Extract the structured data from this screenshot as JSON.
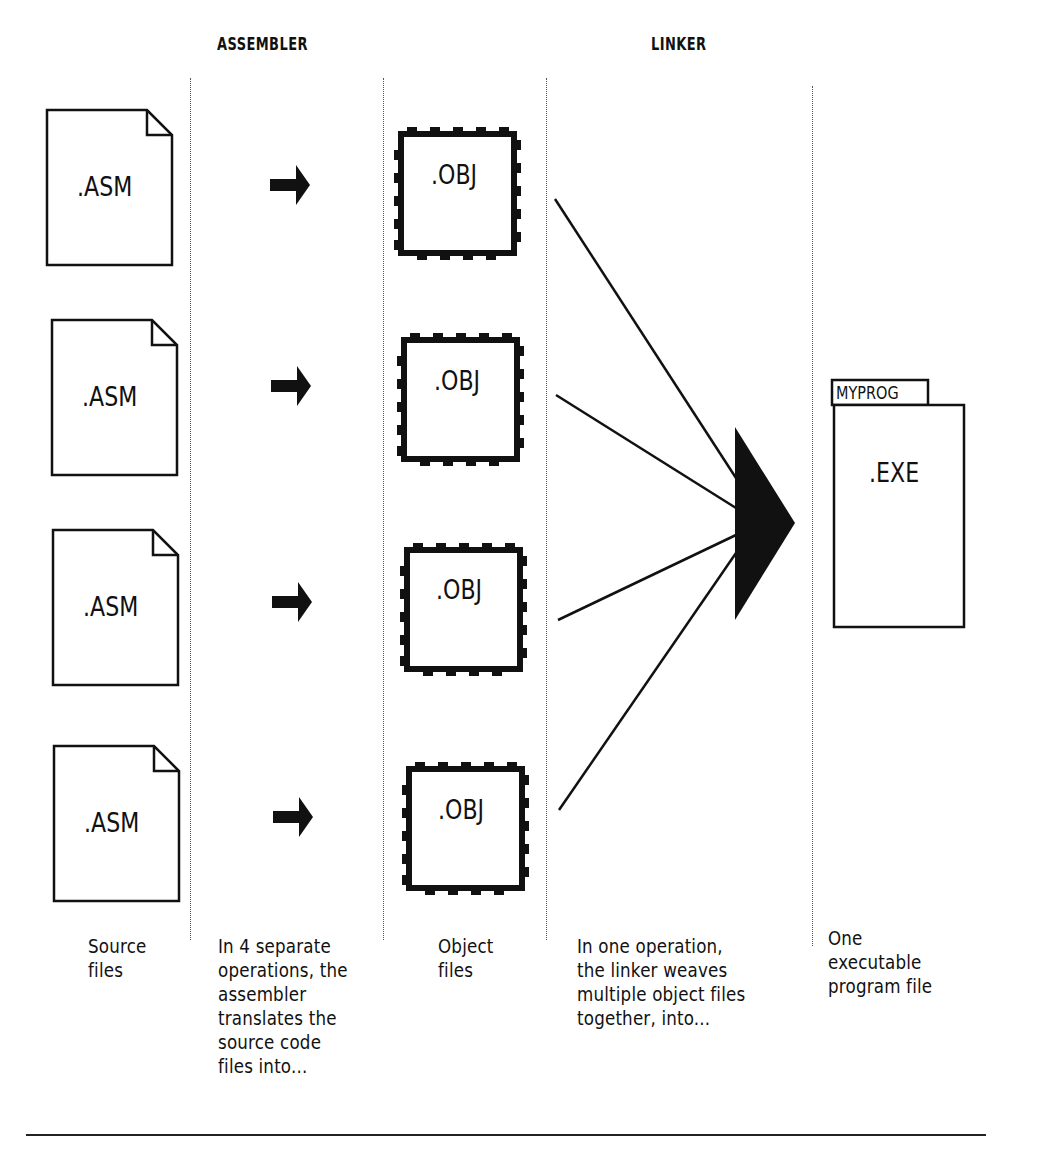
{
  "headers": {
    "assembler": "ASSEMBLER",
    "linker": "LINKER"
  },
  "source_files": [
    {
      "label": ".ASM"
    },
    {
      "label": ".ASM"
    },
    {
      "label": ".ASM"
    },
    {
      "label": ".ASM"
    }
  ],
  "object_files": [
    {
      "label": ".OBJ"
    },
    {
      "label": ".OBJ"
    },
    {
      "label": ".OBJ"
    },
    {
      "label": ".OBJ"
    }
  ],
  "executable": {
    "tab_label": "MYPROG",
    "label": ".EXE"
  },
  "icons": {
    "assemble_arrow": "right-arrow",
    "link_merge": "triangle-right",
    "source_file": "document-folded-corner",
    "object_file": "stamp-perforated-box",
    "executable_file": "tabbed-folder"
  },
  "captions": {
    "source": "Source\nfiles",
    "assembler": "In 4 separate\noperations, the\nassembler\ntranslates the\nsource code\nfiles into...",
    "object": "Object\nfiles",
    "linker": "In one operation,\nthe linker weaves\nmultiple object files\ntogether, into...",
    "executable": "  One\nexecutable\nprogram file"
  },
  "colors": {
    "ink": "#111111",
    "background": "#ffffff"
  }
}
